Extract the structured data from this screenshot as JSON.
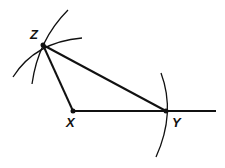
{
  "diagram": {
    "points": [
      {
        "label": "Z",
        "x": 43,
        "y": 45
      },
      {
        "label": "X",
        "x": 73,
        "y": 111
      },
      {
        "label": "Y",
        "x": 166,
        "y": 111
      }
    ],
    "segments": [
      [
        "Z",
        "X"
      ],
      [
        "Z",
        "Y"
      ],
      [
        "X",
        "Y"
      ]
    ],
    "ray": {
      "from": "X",
      "to_x": 216
    },
    "arcs": 3,
    "stroke_color": "#111111"
  }
}
